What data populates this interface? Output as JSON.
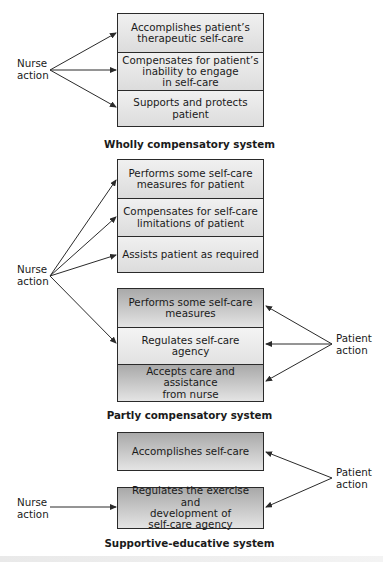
{
  "sections": [
    {
      "id": "wholly",
      "caption": "Wholly compensatory system",
      "nurse_label": "Nurse\naction",
      "boxes": [
        {
          "text": "Accomplishes patient’s\ntherapeutic self-care",
          "actor": "nurse"
        },
        {
          "text": "Compensates for patient’s\ninability to engage\nin self-care",
          "actor": "nurse"
        },
        {
          "text": "Supports and protects\npatient",
          "actor": "nurse"
        }
      ]
    },
    {
      "id": "partly",
      "caption": "Partly compensatory system",
      "nurse_label": "Nurse\naction",
      "patient_label": "Patient\naction",
      "nurse_boxes": [
        {
          "text": "Performs some self-care\nmeasures for patient",
          "actor": "nurse"
        },
        {
          "text": "Compensates for self-care\nlimitations of patient",
          "actor": "nurse"
        },
        {
          "text": "Assists patient as required",
          "actor": "nurse"
        }
      ],
      "shared_boxes": [
        {
          "text": "Performs some self-care\nmeasures",
          "actor": "patient"
        },
        {
          "text": "Regulates self-care agency",
          "actor": "both"
        },
        {
          "text": "Accepts care and assistance\nfrom nurse",
          "actor": "patient"
        }
      ]
    },
    {
      "id": "supportive",
      "caption": "Supportive-educative system",
      "nurse_label": "Nurse\naction",
      "patient_label": "Patient\naction",
      "boxes": [
        {
          "text": "Accomplishes self-care",
          "actor": "patient"
        },
        {
          "text": "Regulates the exercise and\ndevelopment of\nself-care agency",
          "actor": "both"
        }
      ]
    }
  ],
  "colors": {
    "line": "#2a2a2a",
    "nurse_fill": "#e6e6e6",
    "patient_fill_top": "#a9a9a9",
    "patient_fill_bottom": "#e4e4e4"
  }
}
